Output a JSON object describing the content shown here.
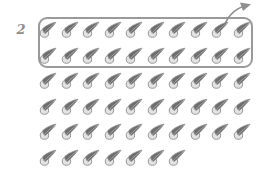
{
  "page": {
    "background_color": "#ffffff",
    "width": 265,
    "height": 177
  },
  "group_label": {
    "text": "2",
    "color": "#8d8d8d",
    "description": "handwritten numeral labelling the grouped set"
  },
  "grouping_box": {
    "border_color": "#9a9a9a",
    "contains_rows": 2,
    "contains_count": 20
  },
  "callout_arrow": {
    "name": "curved-arrow-up-right",
    "color": "#8f8f8f",
    "direction": "up-right"
  },
  "objects": {
    "icon_name": "seed-teardrop-icon",
    "fill_dark": "#6e6e6e",
    "fill_light": "#e3e3e3",
    "outline": "#8a8a8a",
    "total_count": 57,
    "rows_in_box": 2,
    "rows": [
      {
        "index": 1,
        "count": 10,
        "in_box": true
      },
      {
        "index": 2,
        "count": 10,
        "in_box": true
      },
      {
        "index": 3,
        "count": 10,
        "in_box": false
      },
      {
        "index": 4,
        "count": 10,
        "in_box": false
      },
      {
        "index": 5,
        "count": 10,
        "in_box": false
      },
      {
        "index": 6,
        "count": 7,
        "in_box": false
      }
    ]
  },
  "chart_data": {
    "type": "table",
    "title": "",
    "categories": [
      "Row 1",
      "Row 2",
      "Row 3",
      "Row 4",
      "Row 5",
      "Row 6"
    ],
    "values": [
      10,
      10,
      10,
      10,
      10,
      7
    ],
    "xlabel": "Row",
    "ylabel": "Number of seeds",
    "annotations": [
      "Grouped set labelled 2 contains 20 seeds (rows 1-2)"
    ]
  }
}
